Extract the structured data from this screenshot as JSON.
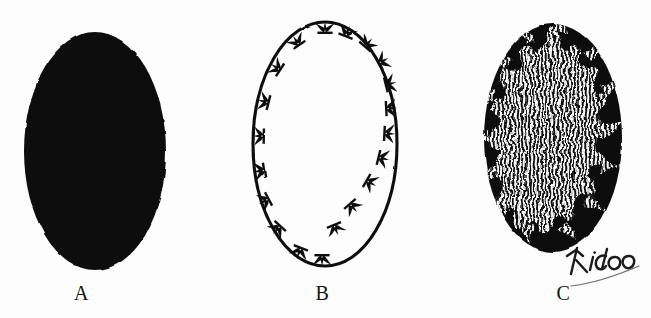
{
  "figure": {
    "background_color": "#fdfdfd",
    "ink_color": "#111111",
    "panel_count": 3
  },
  "panels": [
    {
      "id": "a",
      "label": "A",
      "description": "Solid black filled oval",
      "fill": "solid-black",
      "fill_color": "#111111",
      "outline_color": "#111111",
      "ellipse": {
        "cx": 95,
        "cy": 151,
        "rx": 71,
        "ry": 119
      },
      "marks": 0,
      "interior_pattern": "none"
    },
    {
      "id": "b",
      "label": "B",
      "description": "Oval outline with radiating forked marks around perimeter",
      "fill": "none",
      "fill_color": "#ffffff",
      "outline_color": "#111111",
      "outline_width": 3,
      "ellipse": {
        "cx": 108,
        "cy": 144,
        "rx": 72,
        "ry": 122
      },
      "marks": 18,
      "mark_shape": "forked-trident",
      "mark_direction": "outward",
      "interior_pattern": "none"
    },
    {
      "id": "c",
      "label": "C",
      "description": "Black oval with white wavy-line filled interior bounded by a jagged radiating margin",
      "fill": "solid-black",
      "fill_color": "#111111",
      "outline_color": "#111111",
      "ellipse": {
        "cx": 119,
        "cy": 138,
        "rx": 69,
        "ry": 114
      },
      "marks": 0,
      "interior_pattern": "vertical-wavy-lines",
      "interior_line_color": "#fbfbfb",
      "interior_line_spacing": 4,
      "interior_margin": "jagged-radiating"
    }
  ],
  "signature": {
    "text": "Kido",
    "style": "handwritten",
    "has_underline": true,
    "color": "#1a1a1a"
  }
}
